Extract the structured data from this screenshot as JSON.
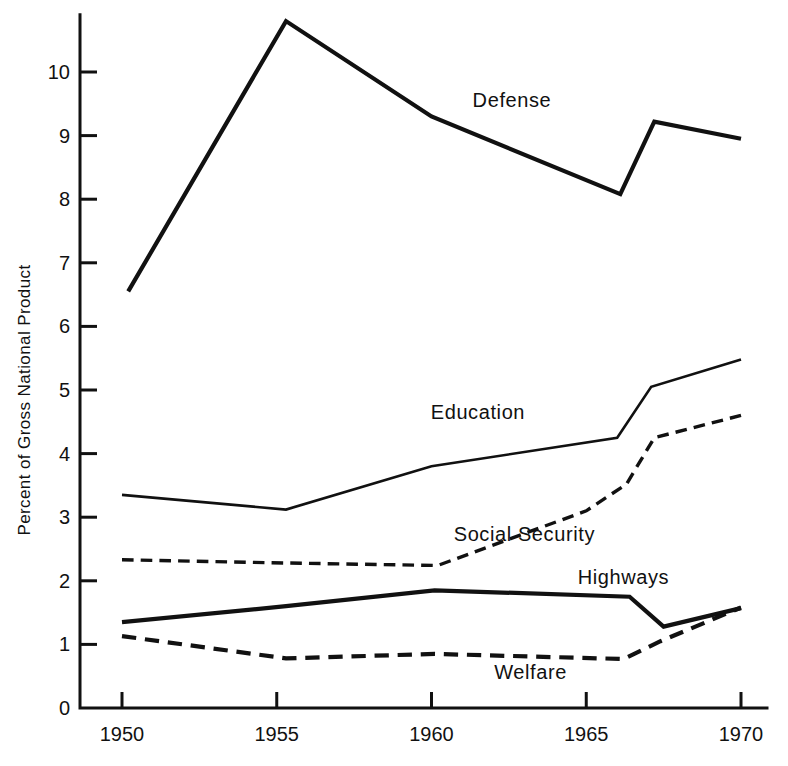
{
  "chart_data": {
    "type": "line",
    "title": "",
    "xlabel": "",
    "ylabel": "Percent of Gross National Product",
    "xlim": [
      1949.3,
      1970.2
    ],
    "ylim": [
      0,
      10.9
    ],
    "xticks": [
      "1950",
      "1955",
      "1960",
      "1965",
      "1970"
    ],
    "xtick_values": [
      1950,
      1955,
      1960,
      1965,
      1970
    ],
    "yticks": [
      "0",
      "1",
      "2",
      "3",
      "4",
      "5",
      "6",
      "7",
      "8",
      "9",
      "10"
    ],
    "ytick_values": [
      0,
      1,
      2,
      3,
      4,
      5,
      6,
      7,
      8,
      9,
      10
    ],
    "grid": false,
    "legend": "inline-labels",
    "series": [
      {
        "name": "Defense",
        "style": "solid",
        "width": 4.2,
        "label_x": 1962.6,
        "label_y": 9.45,
        "x": [
          1950.2,
          1955.3,
          1960.0,
          1966.1,
          1967.2,
          1970.0
        ],
        "y": [
          6.55,
          10.8,
          9.3,
          8.08,
          9.22,
          8.95
        ]
      },
      {
        "name": "Education",
        "style": "solid",
        "width": 2.6,
        "label_x": 1961.5,
        "label_y": 4.55,
        "x": [
          1950.0,
          1955.3,
          1960.0,
          1966.0,
          1967.1,
          1970.0
        ],
        "y": [
          3.35,
          3.12,
          3.8,
          4.25,
          5.05,
          5.48
        ]
      },
      {
        "name": "Social Security",
        "style": "dashed",
        "width": 3.4,
        "label_x": 1963.0,
        "label_y": 2.62,
        "x": [
          1950.0,
          1955.3,
          1960.2,
          1965.0,
          1966.3,
          1967.2,
          1970.0
        ],
        "y": [
          2.33,
          2.28,
          2.24,
          3.1,
          3.52,
          4.25,
          4.6
        ]
      },
      {
        "name": "Highways",
        "style": "solid",
        "width": 4.2,
        "label_x": 1966.2,
        "label_y": 1.95,
        "x": [
          1950.0,
          1955.3,
          1960.1,
          1966.4,
          1967.5,
          1970.0
        ],
        "y": [
          1.35,
          1.6,
          1.85,
          1.75,
          1.28,
          1.57
        ]
      },
      {
        "name": "Welfare",
        "style": "dashed",
        "width": 4.2,
        "label_x": 1963.2,
        "label_y": 0.45,
        "x": [
          1950.0,
          1955.3,
          1960.1,
          1966.2,
          1967.4,
          1970.0
        ],
        "y": [
          1.13,
          0.78,
          0.85,
          0.77,
          1.05,
          1.58
        ]
      }
    ]
  },
  "plot_geometry": {
    "x_pixels": [
      122,
      741
    ],
    "x_domain": [
      1950,
      1970
    ],
    "y_pixels": [
      708,
      72
    ],
    "y_domain": [
      0,
      10
    ],
    "axis_color": "#111111"
  }
}
